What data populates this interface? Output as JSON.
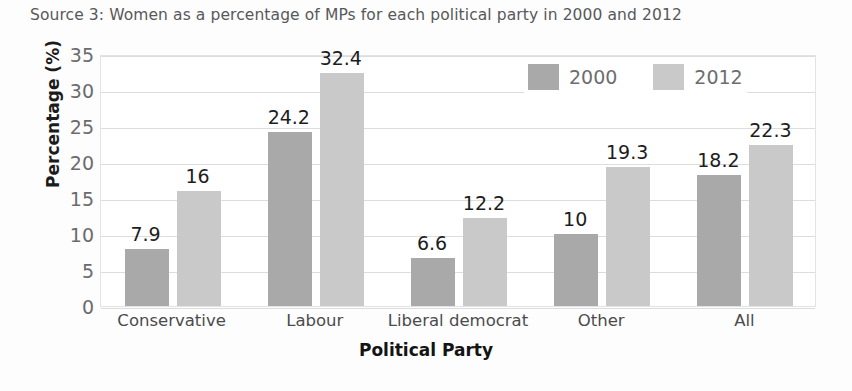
{
  "chart_data": {
    "type": "bar",
    "title": "Source 3: Women as a percentage of MPs for each political party in 2000 and 2012",
    "xlabel": "Political Party",
    "ylabel": "Percentage (%)",
    "ylim": [
      0,
      35
    ],
    "yticks": [
      "0",
      "5",
      "10",
      "15",
      "20",
      "25",
      "30",
      "35"
    ],
    "ytick_values": [
      0,
      5,
      10,
      15,
      20,
      25,
      30,
      35
    ],
    "grid": true,
    "legend_position": "top-right",
    "categories": [
      "Conservative",
      "Labour",
      "Liberal democrat",
      "Other",
      "All"
    ],
    "series": [
      {
        "name": "2000",
        "color": "#a9a9a9",
        "values": [
          7.9,
          24.2,
          6.6,
          10,
          18.2
        ],
        "labels": [
          "7.9",
          "24.2",
          "6.6",
          "10",
          "18.2"
        ]
      },
      {
        "name": "2012",
        "color": "#c9c9c9",
        "values": [
          16,
          32.4,
          12.2,
          19.3,
          22.3
        ],
        "labels": [
          "16",
          "32.4",
          "12.2",
          "19.3",
          "22.3"
        ]
      }
    ]
  }
}
